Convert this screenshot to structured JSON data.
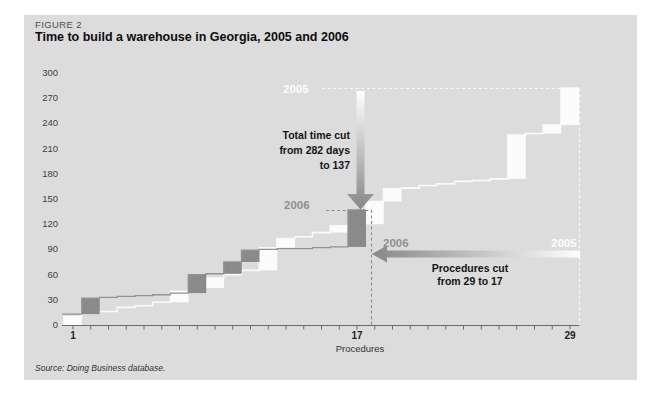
{
  "figure": {
    "label": "FIGURE 2",
    "title": "Time to build a warehouse in Georgia, 2005 and 2006",
    "source": "Source: Doing Business database."
  },
  "chart_data": {
    "type": "line",
    "subtype": "step-cumulative",
    "xlabel": "Procedures",
    "ylabel": "",
    "xlim": [
      1,
      29
    ],
    "ylim": [
      0,
      300
    ],
    "x_ticks": [
      1,
      17,
      29
    ],
    "y_ticks": [
      0,
      30,
      60,
      90,
      120,
      150,
      180,
      210,
      240,
      270,
      300
    ],
    "grid": false,
    "series": [
      {
        "name": "2005",
        "color": "#fbfbfb",
        "line_color": "#fafafa",
        "procedures": 29,
        "total_days": 282,
        "start_from_zero": true,
        "cumulative_days": [
          10,
          14,
          16,
          21,
          23,
          27,
          40,
          44,
          56,
          60,
          65,
          92,
          103,
          105,
          110,
          118,
          120,
          147,
          162,
          163,
          166,
          168,
          171,
          172,
          174,
          226,
          228,
          238,
          282
        ]
      },
      {
        "name": "2006",
        "color": "#8a8a8a",
        "line_color": "#929292",
        "procedures": 17,
        "total_days": 137,
        "start_from_zero": false,
        "cumulative_days": [
          13,
          32,
          33,
          34,
          35,
          36,
          38,
          60,
          61,
          75,
          89,
          90,
          91,
          91,
          92,
          93,
          137
        ]
      }
    ],
    "annotations": {
      "total_time_cut": [
        "Total time cut",
        "from 282 days",
        "to 137"
      ],
      "procedures_cut": [
        "Procedures cut",
        "from 29 to 17"
      ]
    }
  },
  "colors": {
    "panel_bg": "#dcdcdc",
    "axis": "#6b6b6b",
    "dashed_2005": "#f8f8f8",
    "dashed_2006": "#8a8a8a",
    "arrow_gray": "#878787",
    "arrow_white": "#fefefe"
  }
}
